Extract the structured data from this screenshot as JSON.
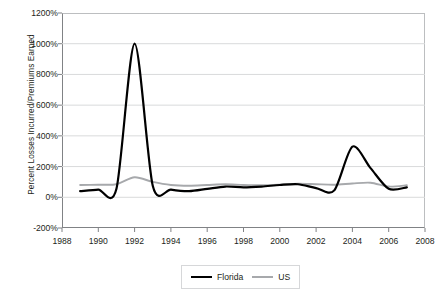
{
  "chart_data": {
    "type": "line",
    "title": "",
    "xlabel": "",
    "ylabel": "Percent Losses Incurred/Premiums Earned",
    "xlim": [
      1988,
      2008
    ],
    "ylim": [
      -200,
      1200
    ],
    "ytick_format": "percent",
    "yticks": [
      -200,
      0,
      200,
      400,
      600,
      800,
      1000,
      1200
    ],
    "ytick_labels": [
      "-200%",
      "0%",
      "200%",
      "400%",
      "600%",
      "800%",
      "1000%",
      "1200%"
    ],
    "xticks": [
      1988,
      1990,
      1992,
      1994,
      1996,
      1998,
      2000,
      2002,
      2004,
      2006,
      2008
    ],
    "xtick_labels": [
      "1988",
      "1990",
      "1992",
      "1994",
      "1996",
      "1998",
      "2000",
      "2002",
      "2004",
      "2006",
      "2008"
    ],
    "grid": "horizontal",
    "legend_position": "bottom-center",
    "x": [
      1989,
      1990,
      1991,
      1992,
      1993,
      1994,
      1995,
      1996,
      1997,
      1998,
      1999,
      2000,
      2001,
      2002,
      2003,
      2004,
      2005,
      2006,
      2007
    ],
    "series": [
      {
        "name": "Florida",
        "color": "#000000",
        "values": [
          40,
          50,
          55,
          1000,
          75,
          50,
          40,
          55,
          70,
          65,
          70,
          80,
          85,
          60,
          45,
          330,
          190,
          55,
          65
        ]
      },
      {
        "name": "US",
        "color": "#a7a9ac",
        "values": [
          80,
          82,
          85,
          130,
          100,
          80,
          75,
          80,
          85,
          80,
          78,
          82,
          88,
          85,
          82,
          90,
          95,
          70,
          78
        ]
      }
    ]
  },
  "legend": {
    "items": [
      {
        "label": "Florida"
      },
      {
        "label": "US"
      }
    ]
  },
  "colors": {
    "florida_line": "#000000",
    "us_line": "#a7a9ac",
    "gridline": "#d9dadb",
    "axis": "#808285",
    "text": "#231f20",
    "background": "#ffffff"
  }
}
